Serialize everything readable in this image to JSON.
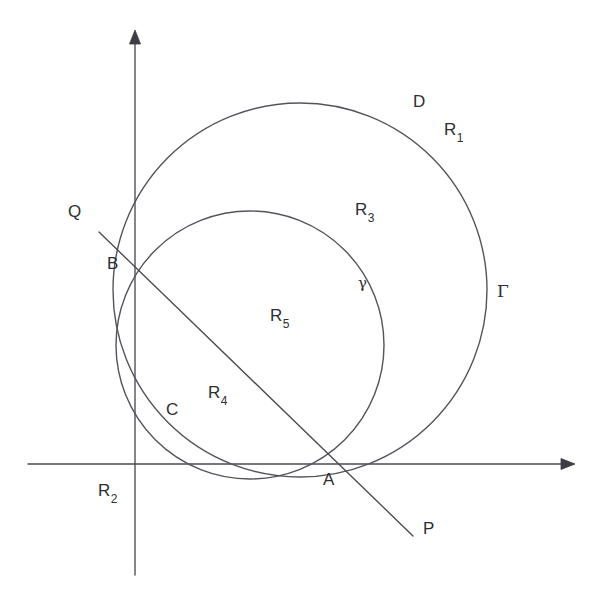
{
  "figure": {
    "background_color": "#ffffff",
    "stroke_color": "#54545c",
    "label_color": "#2e2e34",
    "axes": {
      "name": "cartesian-axes",
      "origin": {
        "x": 135,
        "y": 464
      },
      "x_axis": {
        "from_x": 28,
        "to_x": 575,
        "y": 464,
        "arrow": "right"
      },
      "y_axis": {
        "x": 135,
        "from_y": 575,
        "to_y": 30,
        "arrow": "up"
      }
    },
    "circles": [
      {
        "id": "Gamma",
        "label": "Γ",
        "role": "large-circle",
        "cx": 300,
        "cy": 290,
        "r": 187,
        "label_x": 497,
        "label_y": 290
      },
      {
        "id": "gamma",
        "label": "γ",
        "role": "small-circle",
        "cx": 250,
        "cy": 345,
        "r": 134,
        "label_x": 358,
        "label_y": 282
      }
    ],
    "line": {
      "name": "line-PQ",
      "from": {
        "x": 99,
        "y": 232
      },
      "to": {
        "x": 413,
        "y": 536
      },
      "endpoint_labels": [
        {
          "text": "Q",
          "x": 68,
          "y": 210
        },
        {
          "text": "P",
          "x": 423,
          "y": 527
        }
      ]
    },
    "points": [
      {
        "id": "A",
        "label": "A",
        "x": 330,
        "y": 464,
        "label_x": 323,
        "label_y": 478
      },
      {
        "id": "B",
        "label": "B",
        "x": 135,
        "y": 272,
        "label_x": 107,
        "label_y": 262
      }
    ],
    "arc_labels": [
      {
        "id": "D",
        "text": "D",
        "x": 413,
        "y": 100
      },
      {
        "id": "C",
        "text": "C",
        "x": 166,
        "y": 408
      }
    ],
    "region_labels": [
      {
        "id": "R1",
        "base": "R",
        "sub": "1",
        "x": 444,
        "y": 128
      },
      {
        "id": "R2",
        "base": "R",
        "sub": "2",
        "x": 98,
        "y": 489
      },
      {
        "id": "R3",
        "base": "R",
        "sub": "3",
        "x": 355,
        "y": 208
      },
      {
        "id": "R4",
        "base": "R",
        "sub": "4",
        "x": 208,
        "y": 391
      },
      {
        "id": "R5",
        "base": "R",
        "sub": "5",
        "x": 270,
        "y": 314
      }
    ]
  }
}
